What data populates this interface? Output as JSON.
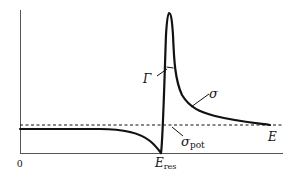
{
  "diagram": {
    "type": "resonance-cross-section",
    "axes": {
      "origin_label": "0",
      "x_label": "E",
      "x_marker_label": "E",
      "x_marker_subscript": "res"
    },
    "curves": [
      {
        "name": "sigma",
        "label": "σ"
      }
    ],
    "reference_line": {
      "label": "σ",
      "subscript": "pot",
      "style": "dashed"
    },
    "annotations": [
      {
        "label": "Γ",
        "meaning": "resonance width"
      }
    ]
  },
  "labels": {
    "origin": "0",
    "gamma": "Γ",
    "sigma": "σ",
    "sigma_pot_main": "σ",
    "sigma_pot_sub": "pot",
    "energy": "E",
    "e_res_main": "E",
    "e_res_sub": "res"
  }
}
